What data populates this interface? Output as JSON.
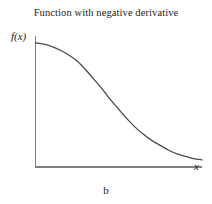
{
  "figure": {
    "title": "Function with negative derivative",
    "caption": "b",
    "ylabel": "f(x)",
    "xlabel": "x"
  },
  "chart_data": {
    "type": "line",
    "title": "Function with negative derivative",
    "subtitle": "",
    "caption": "b",
    "xlabel": "x",
    "ylabel": "f(x)",
    "grid": false,
    "legend": null,
    "axis_color": "#808080",
    "curve_color": "#4a4a4a",
    "background": "#ffffff",
    "xlim": [
      0,
      1
    ],
    "ylim": [
      0,
      1
    ],
    "xticks": [],
    "yticks": [],
    "annotations": [
      "Curve decreases monotonically from a high plateau to a near-zero asymptote",
      "Negative derivative everywhere",
      "Inflection point near the middle of the x range"
    ],
    "series": [
      {
        "name": "f(x)",
        "x": [
          0.0,
          0.05,
          0.1,
          0.15,
          0.2,
          0.25,
          0.3,
          0.35,
          0.4,
          0.45,
          0.5,
          0.55,
          0.6,
          0.65,
          0.7,
          0.75,
          0.8,
          0.85,
          0.9,
          0.95,
          1.0
        ],
        "y": [
          1.0,
          0.99,
          0.97,
          0.94,
          0.9,
          0.85,
          0.78,
          0.7,
          0.62,
          0.53,
          0.45,
          0.37,
          0.3,
          0.24,
          0.19,
          0.15,
          0.11,
          0.08,
          0.06,
          0.04,
          0.03
        ]
      }
    ]
  }
}
